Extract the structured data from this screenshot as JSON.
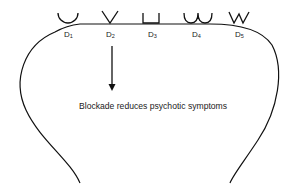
{
  "diagram": {
    "receptors": [
      {
        "id": "D1",
        "letter": "D",
        "sub": "1",
        "shape": "cup"
      },
      {
        "id": "D2",
        "letter": "D",
        "sub": "2",
        "shape": "v"
      },
      {
        "id": "D3",
        "letter": "D",
        "sub": "3",
        "shape": "square-cup"
      },
      {
        "id": "D4",
        "letter": "D",
        "sub": "4",
        "shape": "double-cup"
      },
      {
        "id": "D5",
        "letter": "D",
        "sub": "5",
        "shape": "w"
      }
    ],
    "arrow_from": "D2",
    "caption": "Blockade reduces psychotic symptoms",
    "line_color": "#111111"
  }
}
